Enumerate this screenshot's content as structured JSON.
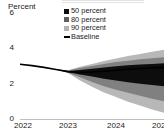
{
  "chart_data": {
    "type": "area",
    "title": "",
    "xlabel": "",
    "ylabel": "Percent",
    "ylim": [
      0,
      6
    ],
    "xlim": [
      2022.0,
      2025.0
    ],
    "yticks": [
      0,
      2,
      4,
      6
    ],
    "ytick_labels": [
      "0",
      "2",
      "4",
      "6"
    ],
    "xticks": [
      2022,
      2023,
      2024,
      2025
    ],
    "xtick_labels": [
      "2022",
      "2023",
      "2024",
      "2025"
    ],
    "grid": false,
    "legend_position": "top-center",
    "legend": [
      {
        "label": "50 percent",
        "marker": "square",
        "color": "#0d0d0d"
      },
      {
        "label": "80 percent",
        "marker": "square",
        "color": "#5e5e5e"
      },
      {
        "label": "90 percent",
        "marker": "square",
        "color": "#b3b3b3"
      },
      {
        "label": "Baseline",
        "marker": "line",
        "color": "#000000"
      }
    ],
    "x": [
      2022.0,
      2022.25,
      2022.5,
      2022.75,
      2023.0,
      2023.25,
      2023.5,
      2023.75,
      2024.0,
      2024.25,
      2024.5,
      2024.75,
      2025.0
    ],
    "series": [
      {
        "name": "Baseline",
        "type": "line",
        "color": "#000000",
        "values": [
          3.1,
          3.02,
          2.92,
          2.8,
          2.68,
          2.64,
          2.66,
          2.7,
          2.76,
          2.82,
          2.86,
          2.89,
          2.92
        ]
      },
      {
        "name": "90 percent",
        "type": "band",
        "color": "#b8b8b8",
        "lower": [
          3.1,
          3.02,
          2.92,
          2.8,
          2.6,
          2.18,
          1.82,
          1.5,
          1.24,
          0.98,
          0.76,
          0.54,
          0.35
        ],
        "upper": [
          3.1,
          3.02,
          2.92,
          2.8,
          2.76,
          2.96,
          3.12,
          3.28,
          3.42,
          3.56,
          3.68,
          3.8,
          3.92
        ]
      },
      {
        "name": "80 percent",
        "type": "band",
        "color": "#808080",
        "lower": [
          3.1,
          3.02,
          2.92,
          2.8,
          2.62,
          2.36,
          2.1,
          1.86,
          1.66,
          1.48,
          1.32,
          1.14,
          1.0
        ],
        "upper": [
          3.1,
          3.02,
          2.92,
          2.8,
          2.74,
          2.88,
          3.0,
          3.12,
          3.22,
          3.3,
          3.38,
          3.44,
          3.5
        ]
      },
      {
        "name": "50 percent",
        "type": "band",
        "color": "#0d0d0d",
        "lower": [
          3.1,
          3.02,
          2.92,
          2.8,
          2.64,
          2.52,
          2.4,
          2.28,
          2.18,
          2.08,
          2.0,
          1.92,
          1.85
        ],
        "upper": [
          3.1,
          3.02,
          2.92,
          2.8,
          2.72,
          2.78,
          2.84,
          2.92,
          2.98,
          3.04,
          3.08,
          3.12,
          3.15
        ]
      }
    ]
  }
}
